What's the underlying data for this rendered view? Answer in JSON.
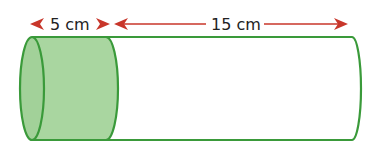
{
  "diagram": {
    "type": "cylinder-dimension",
    "labels": {
      "shaded_length": "5 cm",
      "remaining_length": "15 cm"
    },
    "colors": {
      "outline": "#3a9a3a",
      "fill": "#a9d6a0",
      "arrow": "#c8362a",
      "text": "#222222"
    }
  }
}
